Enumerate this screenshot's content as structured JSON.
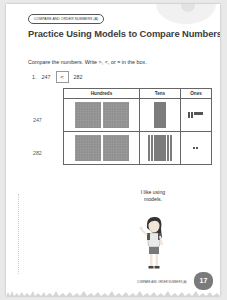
{
  "header": {
    "section_pill": "COMPARE AND ORDER NUMBERS (A)",
    "title": "Practice Using Models to Compare Numbers"
  },
  "instructions": "Compare the numbers. Write >, <, or = in the box.",
  "problem": {
    "number": "1.",
    "left_value": "247",
    "answer": "<",
    "right_value": "282"
  },
  "table": {
    "headers": [
      "Hundreds",
      "Tens",
      "Ones"
    ],
    "rows": [
      {
        "label": "247",
        "hundreds": 2,
        "tens": 4,
        "ones": 7
      },
      {
        "label": "282",
        "hundreds": 2,
        "tens": 8,
        "ones": 2
      }
    ]
  },
  "speech_bubble": "I like using models.",
  "footer": {
    "running_title": "COMPARE AND ORDER NUMBERS (A)",
    "page_number": "17"
  },
  "colors": {
    "title": "#3d3d3d",
    "model_fill": "#8d8d8d",
    "page_badge": "#7a7a7a"
  }
}
